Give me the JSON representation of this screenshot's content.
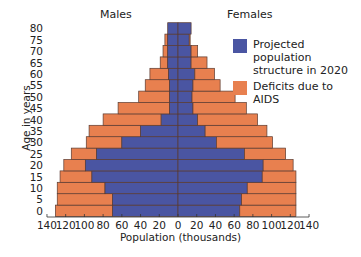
{
  "chart_data": {
    "type": "bar",
    "orientation": "horizontal",
    "subtype": "population-pyramid",
    "title": "",
    "xlabel": "Population (thousands)",
    "ylabel": "Age in years",
    "side_labels": {
      "left": "Males",
      "right": "Females"
    },
    "categories": [
      "0",
      "5",
      "10",
      "15",
      "20",
      "25",
      "30",
      "35",
      "40",
      "45",
      "50",
      "55",
      "60",
      "65",
      "70",
      "75",
      "80"
    ],
    "x_ticks": [
      140,
      120,
      100,
      80,
      60,
      40,
      20,
      0,
      20,
      40,
      60,
      80,
      100,
      120,
      140
    ],
    "xlim": [
      -140,
      140
    ],
    "grid": false,
    "legend_position": "upper right",
    "series": [
      {
        "name": "Projected population structure in 2020",
        "color": "#4a55a2",
        "males": [
          70,
          70,
          78,
          92,
          99,
          87,
          60,
          40,
          18,
          9,
          9,
          9,
          10,
          11,
          11,
          11,
          11
        ],
        "females": [
          66,
          68,
          74,
          90,
          91,
          71,
          41,
          29,
          21,
          16,
          15,
          16,
          18,
          14,
          14,
          12,
          14
        ]
      },
      {
        "name": "Deficits due to AIDS",
        "color": "#e8804f",
        "males": [
          61,
          59,
          51,
          34,
          23,
          27,
          38,
          55,
          62,
          55,
          33,
          26,
          20,
          8,
          5,
          3,
          0
        ],
        "females": [
          60,
          58,
          52,
          36,
          32,
          44,
          60,
          66,
          64,
          57,
          46,
          29,
          21,
          17,
          7,
          1,
          0
        ]
      }
    ],
    "totals": {
      "males": [
        131,
        129,
        129,
        126,
        122,
        114,
        98,
        95,
        80,
        64,
        42,
        35,
        30,
        19,
        16,
        14,
        11
      ],
      "females": [
        126,
        126,
        126,
        126,
        123,
        115,
        101,
        95,
        85,
        73,
        61,
        45,
        39,
        31,
        21,
        13,
        14
      ]
    }
  },
  "labels": {
    "males": "Males",
    "females": "Females",
    "ylabel": "Age in years",
    "xlabel": "Population (thousands)"
  },
  "legend": [
    {
      "label_line1": "Projected population",
      "label_line2": "structure in 2020",
      "color": "#4a55a2"
    },
    {
      "label_line1": "Deficits due to AIDS",
      "label_line2": "",
      "color": "#e8804f"
    }
  ]
}
